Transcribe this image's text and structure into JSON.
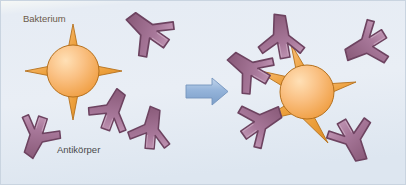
{
  "figure": {
    "type": "biology-diagram",
    "topic": "antibody-binding-to-bacterium",
    "language": "de",
    "width": 406,
    "height": 185
  },
  "canvas": {
    "background_color": "#e9eef5",
    "top_band_color": "#fbfcfa",
    "border_color": "#c9d4e0"
  },
  "labels": {
    "bakterium": "Bakterium",
    "antikoerper": "Antikörper"
  },
  "colors": {
    "bacterium_body": "#f4a94e",
    "bacterium_body_light": "#fbd2a0",
    "bacterium_spike": "#e8972f",
    "bacterium_outline": "#a8641b",
    "antibody_fill": "#a2728f",
    "antibody_light": "#c29ab4",
    "antibody_outline": "#6d4360",
    "arrow_fill": "#8fafd4",
    "arrow_light": "#b9cde6",
    "arrow_outline": "#6e92bd",
    "label_text": "#5a5047"
  },
  "left_panel": {
    "name": "free-antibodies-and-bacterium",
    "bacterium": {
      "label": "Bakterium",
      "center_x": 73,
      "center_y": 71,
      "radius": 26,
      "spike_count": 4,
      "spike_directions_deg": [
        90,
        0,
        270,
        180
      ]
    },
    "antibodies": [
      {
        "id": "antibody-left-1",
        "cx": 148,
        "cy": 30,
        "rotation_deg": 125,
        "bound": false
      },
      {
        "id": "antibody-left-2",
        "cx": 113,
        "cy": 110,
        "rotation_deg": 200,
        "bound": false
      },
      {
        "id": "antibody-left-3",
        "cx": 152,
        "cy": 128,
        "rotation_deg": 185,
        "bound": false
      },
      {
        "id": "antibody-left-4",
        "cx": 36,
        "cy": 137,
        "rotation_deg": 18,
        "bound": false
      }
    ]
  },
  "arrow": {
    "name": "transformation-arrow",
    "x": 186,
    "y": 78,
    "width": 42,
    "height": 26,
    "direction": "right"
  },
  "right_panel": {
    "name": "antibodies-bound-to-bacterium",
    "bacterium": {
      "center_x": 307,
      "center_y": 92,
      "radius": 27,
      "spike_count": 5,
      "spike_directions_deg": [
        70,
        5,
        300,
        215,
        150
      ]
    },
    "antibodies": [
      {
        "id": "antibody-right-1",
        "cx": 282,
        "cy": 36,
        "rotation_deg": 170,
        "bound": true
      },
      {
        "id": "antibody-right-2",
        "cx": 365,
        "cy": 45,
        "rotation_deg": 58,
        "bound": true
      },
      {
        "id": "antibody-right-3",
        "cx": 352,
        "cy": 141,
        "rotation_deg": 330,
        "bound": true
      },
      {
        "id": "antibody-right-4",
        "cx": 262,
        "cy": 123,
        "rotation_deg": 235,
        "bound": true
      },
      {
        "id": "antibody-right-5",
        "cx": 249,
        "cy": 68,
        "rotation_deg": 120,
        "bound": true
      }
    ]
  }
}
